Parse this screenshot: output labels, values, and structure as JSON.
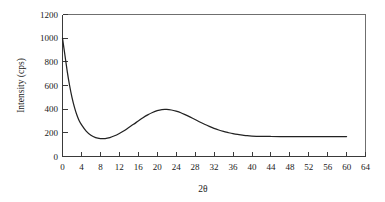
{
  "chart_data": {
    "type": "line",
    "title": "",
    "xlabel": "2θ",
    "ylabel": "Intensity (cps)",
    "xlim": [
      0,
      64
    ],
    "ylim": [
      0,
      1200
    ],
    "grid": false,
    "legend": null,
    "xticks": [
      0,
      4,
      8,
      12,
      16,
      20,
      24,
      28,
      32,
      36,
      40,
      44,
      48,
      52,
      56,
      60,
      64
    ],
    "xtick_labels": [
      "0",
      "4",
      "8",
      "12",
      "16",
      "20",
      "24",
      "28",
      "32",
      "36",
      "40",
      "44",
      "48",
      "52",
      "56",
      "60",
      "64"
    ],
    "yticks": [
      0,
      200,
      400,
      600,
      800,
      1000,
      1200
    ],
    "ytick_labels": [
      "0",
      "200",
      "400",
      "600",
      "800",
      "1000",
      "1200"
    ],
    "series": [
      {
        "name": "diffraction pattern",
        "color": "#222222",
        "x": [
          0,
          0.5,
          1,
          1.5,
          2,
          2.5,
          3,
          3.5,
          4,
          5,
          6,
          7,
          8,
          9,
          10,
          11,
          12,
          13,
          14,
          15,
          16,
          17,
          18,
          19,
          20,
          21,
          22,
          23,
          24,
          25,
          26,
          27,
          28,
          29,
          30,
          31,
          32,
          33,
          34,
          35,
          36,
          37,
          38,
          39,
          40,
          42,
          44,
          46,
          48,
          50,
          52,
          54,
          56,
          58,
          60
        ],
        "y": [
          1000,
          860,
          720,
          600,
          500,
          420,
          355,
          305,
          270,
          215,
          180,
          160,
          152,
          152,
          160,
          175,
          195,
          218,
          245,
          272,
          300,
          328,
          352,
          372,
          388,
          397,
          398,
          393,
          383,
          370,
          352,
          333,
          313,
          292,
          272,
          254,
          238,
          224,
          212,
          202,
          193,
          186,
          181,
          176,
          173,
          170,
          169,
          169,
          169,
          169,
          169,
          169,
          169,
          169,
          169
        ]
      }
    ],
    "annotations": {
      "peak_position": 21,
      "peak_intensity": 398,
      "minimum_position": 8,
      "minimum_intensity": 152,
      "start_intensity": 1000,
      "plateau_intensity": 169
    },
    "colors": {
      "curve": "#222222",
      "frame": "#6f6f6f",
      "axis": "#3a3a3a",
      "background": "#ffffff",
      "text": "#1a1a1a"
    }
  }
}
